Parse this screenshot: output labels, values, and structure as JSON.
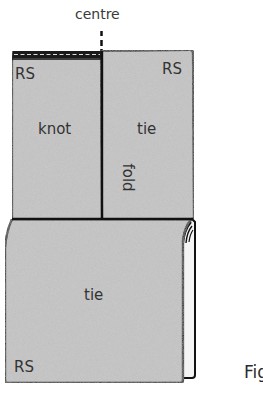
{
  "diagram": {
    "centre_label": "centre",
    "top_left_panel": {
      "side_label": "RS",
      "name_label": "knot"
    },
    "top_right_panel": {
      "side_label": "RS",
      "name_label": "tie"
    },
    "fold_label": "fold",
    "bottom_panel": {
      "name_label": "tie",
      "side_label": "RS"
    },
    "figure_label": "Fig",
    "colors": {
      "fabric_fill": "#bfbfbf",
      "outline": "#111111",
      "fold_underside": "#f4f4f4",
      "text": "#333333"
    }
  }
}
